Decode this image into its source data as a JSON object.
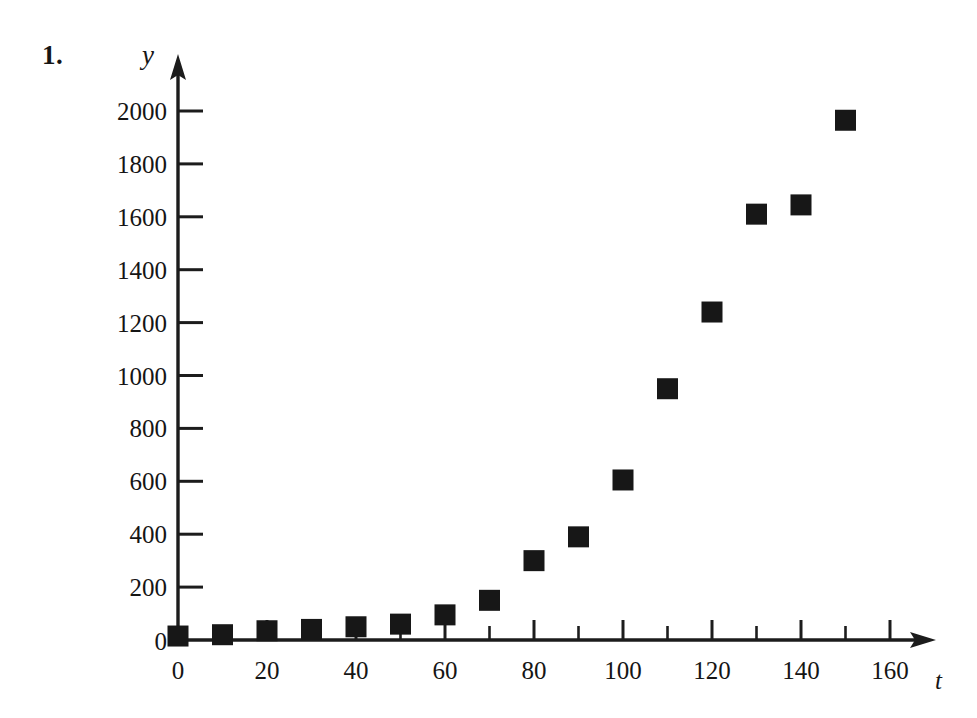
{
  "figure": {
    "problem_number": "1.",
    "y_axis_label": "y",
    "x_axis_label": "t"
  },
  "chart_data": {
    "type": "scatter",
    "title": "",
    "xlabel": "t",
    "ylabel": "y",
    "xlim": [
      0,
      175
    ],
    "ylim": [
      0,
      2100
    ],
    "grid": false,
    "legend": null,
    "marker": "filled-square",
    "marker_color": "#171717",
    "x_ticks": [
      0,
      20,
      40,
      60,
      80,
      100,
      120,
      140,
      160
    ],
    "x_tick_labels": [
      "0",
      "20",
      "40",
      "60",
      "80",
      "100",
      "120",
      "140",
      "160"
    ],
    "x_minor_tick_step": 10,
    "y_ticks": [
      200,
      400,
      600,
      800,
      1000,
      1200,
      1400,
      1600,
      1800,
      2000
    ],
    "y_tick_labels": [
      "200",
      "400",
      "600",
      "800",
      "1000",
      "1200",
      "1400",
      "1600",
      "1800",
      "2000"
    ],
    "y_origin_label": "0",
    "x": [
      0,
      10,
      20,
      30,
      40,
      50,
      60,
      70,
      80,
      90,
      100,
      110,
      120,
      130,
      140,
      150
    ],
    "y": [
      15,
      20,
      35,
      40,
      50,
      60,
      95,
      150,
      300,
      390,
      605,
      950,
      1240,
      1610,
      1645,
      1965
    ],
    "points": [
      {
        "t": 0,
        "y": 15
      },
      {
        "t": 10,
        "y": 20
      },
      {
        "t": 20,
        "y": 35
      },
      {
        "t": 30,
        "y": 40
      },
      {
        "t": 40,
        "y": 50
      },
      {
        "t": 50,
        "y": 60
      },
      {
        "t": 60,
        "y": 95
      },
      {
        "t": 70,
        "y": 150
      },
      {
        "t": 80,
        "y": 300
      },
      {
        "t": 90,
        "y": 390
      },
      {
        "t": 100,
        "y": 605
      },
      {
        "t": 110,
        "y": 950
      },
      {
        "t": 120,
        "y": 1240
      },
      {
        "t": 130,
        "y": 1610
      },
      {
        "t": 140,
        "y": 1645
      },
      {
        "t": 150,
        "y": 1965
      }
    ]
  }
}
